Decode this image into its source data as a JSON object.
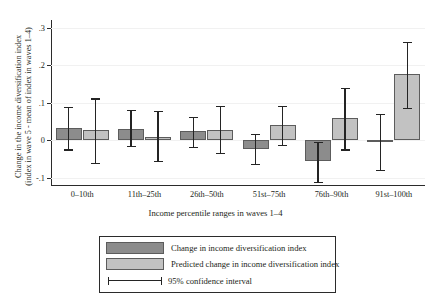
{
  "top_caption_fragment": "",
  "axes": {
    "ylabel_line1": "Change in the income diversification index",
    "ylabel_line2": "(index in wave 5 - mean of index in waves 1–4)",
    "xlabel": "Income percentile ranges in waves 1–4",
    "yticks": [
      ".3",
      ".2",
      ".1",
      "0",
      "-.1"
    ]
  },
  "legend": {
    "item1": "Change in income diversification index",
    "item2": "Predicted change in income diversification index",
    "item3": "95% confidence interval"
  },
  "colors": {
    "dark_bar": "#8c8c8c",
    "light_bar": "#c2c2c2",
    "error_bar": "#242424",
    "axis": "#2b2b2b"
  },
  "chart_data": {
    "type": "bar",
    "title": "",
    "xlabel": "Income percentile ranges in waves 1–4",
    "ylabel": "Change in the income diversification index (index in wave 5 - mean of index in waves 1–4)",
    "categories": [
      "0–10th",
      "11th–25th",
      "26th–50th",
      "51st–75th",
      "76th–90th",
      "91st–100th"
    ],
    "ylim": [
      -0.12,
      0.32
    ],
    "ytick_values": [
      0.3,
      0.2,
      0.1,
      0.0,
      -0.1
    ],
    "grid": true,
    "legend_position": "below-axes",
    "series": [
      {
        "name": "Change in income diversification index",
        "color": "#8c8c8c",
        "values": [
          0.031,
          0.03,
          0.023,
          -0.025,
          -0.057,
          -0.003
        ],
        "ci_low": [
          -0.025,
          -0.015,
          -0.019,
          -0.063,
          -0.112,
          -0.079
        ],
        "ci_high": [
          0.088,
          0.08,
          0.062,
          0.016,
          -0.006,
          0.07
        ]
      },
      {
        "name": "Predicted change in income diversification index",
        "color": "#c2c2c2",
        "values": [
          0.026,
          0.008,
          0.027,
          0.039,
          0.058,
          0.175
        ],
        "ci_low": [
          -0.06,
          -0.055,
          -0.034,
          -0.014,
          -0.025,
          0.085
        ],
        "ci_high": [
          0.111,
          0.078,
          0.09,
          0.09,
          0.14,
          0.262
        ]
      }
    ],
    "error_bar_label": "95% confidence interval"
  }
}
